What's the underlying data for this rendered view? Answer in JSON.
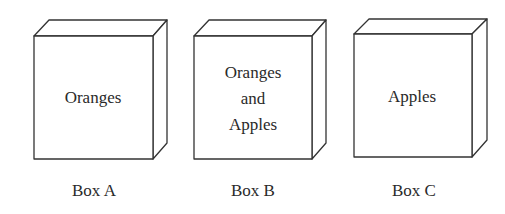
{
  "diagram": {
    "type": "labeled-boxes",
    "boxes": [
      {
        "id": "A",
        "label": "Box A",
        "contents": [
          "Oranges"
        ],
        "front": {
          "x": 34,
          "y": 36,
          "w": 119,
          "h": 123
        },
        "depth": {
          "dx": 15,
          "dy": -16
        }
      },
      {
        "id": "B",
        "label": "Box B",
        "contents": [
          "Oranges",
          "and",
          "Apples"
        ],
        "front": {
          "x": 194,
          "y": 36,
          "w": 118,
          "h": 123
        },
        "depth": {
          "dx": 14,
          "dy": -16
        }
      },
      {
        "id": "C",
        "label": "Box C",
        "contents": [
          "Apples"
        ],
        "front": {
          "x": 354,
          "y": 34,
          "w": 118,
          "h": 123
        },
        "depth": {
          "dx": 15,
          "dy": -15
        }
      }
    ]
  },
  "colors": {
    "stroke": "#333333",
    "text": "#2a2a2a",
    "background": "#ffffff"
  }
}
